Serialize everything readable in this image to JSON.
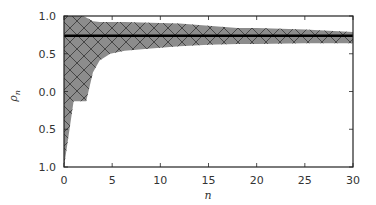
{
  "chart_data": {
    "type": "area",
    "title": "",
    "xlabel": "n",
    "ylabel": "ρ_n",
    "xlim": [
      0,
      30
    ],
    "ylim": [
      -1.0,
      1.0
    ],
    "grid": false,
    "legend": null,
    "x_ticks": [
      0,
      5,
      10,
      15,
      20,
      25,
      30
    ],
    "x_tick_labels": [
      "0",
      "5",
      "10",
      "15",
      "20",
      "25",
      "30"
    ],
    "y_ticks": [
      1.0,
      0.5,
      0.0,
      -0.5,
      -1.0
    ],
    "y_tick_labels": [
      "1.0",
      "0.5",
      "0.0",
      "0.5",
      "1.0"
    ],
    "reference_line": {
      "y": 0.74,
      "color": "#000000"
    },
    "band": {
      "fill": "#8c8c8c",
      "hatch": "cross-diagonal",
      "x": [
        0,
        1,
        2,
        2.3,
        3,
        3.7,
        4.8,
        6.3,
        9,
        12,
        15,
        18,
        20,
        25,
        30
      ],
      "upper": [
        1.0,
        1.0,
        1.0,
        0.98,
        0.93,
        0.92,
        0.92,
        0.92,
        0.91,
        0.9,
        0.87,
        0.84,
        0.84,
        0.82,
        0.79
      ],
      "lower": [
        -1.0,
        -0.13,
        -0.13,
        -0.13,
        0.25,
        0.41,
        0.5,
        0.54,
        0.57,
        0.6,
        0.62,
        0.63,
        0.63,
        0.64,
        0.64
      ]
    }
  }
}
